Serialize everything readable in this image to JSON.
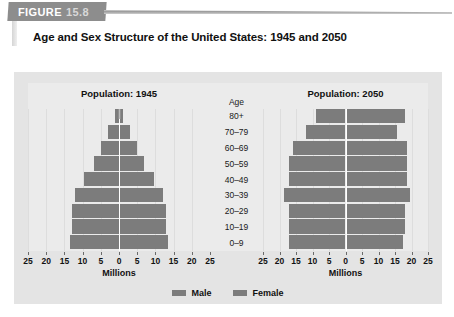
{
  "figure": {
    "tag_word": "FIGURE",
    "tag_number": "15.8",
    "title": "Age and Sex Structure of the United States: 1945 and 2050"
  },
  "legend": {
    "male_label": "Male",
    "female_label": "Female",
    "male_color": "#7c7c7c",
    "female_color": "#7c7c7c"
  },
  "age_column": {
    "header": "Age",
    "groups": [
      "80+",
      "70–79",
      "60–69",
      "50–59",
      "40–49",
      "30–39",
      "20–29",
      "10–19",
      "0–9"
    ]
  },
  "axis": {
    "name": "Millions",
    "tick_labels": [
      "25",
      "20",
      "15",
      "10",
      "5",
      "0",
      "5",
      "10",
      "15",
      "20",
      "25"
    ],
    "max": 25,
    "step": 5
  },
  "panels": [
    {
      "title": "Population: 1945"
    },
    {
      "title": "Population: 2050"
    }
  ],
  "chart_data": [
    {
      "type": "bar",
      "title": "Population: 1945",
      "subtype": "population-pyramid",
      "xlabel": "Millions",
      "ylabel": "Age",
      "xlim": [
        -25,
        25
      ],
      "grid": true,
      "legend_position": "bottom",
      "categories": [
        "80+",
        "70–79",
        "60–69",
        "50–59",
        "40–49",
        "30–39",
        "20–29",
        "10–19",
        "0–9"
      ],
      "series": [
        {
          "name": "Male",
          "side": "left",
          "values": [
            1.0,
            3.0,
            5.0,
            7.0,
            9.5,
            12.0,
            13.0,
            13.0,
            13.5
          ]
        },
        {
          "name": "Female",
          "side": "right",
          "values": [
            1.0,
            3.0,
            5.0,
            7.0,
            9.5,
            12.0,
            13.0,
            13.0,
            13.5
          ]
        }
      ]
    },
    {
      "type": "bar",
      "title": "Population: 2050",
      "subtype": "population-pyramid",
      "xlabel": "Millions",
      "ylabel": "Age",
      "xlim": [
        -25,
        25
      ],
      "grid": true,
      "legend_position": "bottom",
      "categories": [
        "80+",
        "70–79",
        "60–69",
        "50–59",
        "40–49",
        "30–39",
        "20–29",
        "10–19",
        "0–9"
      ],
      "series": [
        {
          "name": "Male",
          "side": "left",
          "values": [
            9.0,
            12.0,
            16.0,
            17.0,
            17.0,
            18.5,
            17.0,
            17.0,
            17.0
          ]
        },
        {
          "name": "Female",
          "side": "right",
          "values": [
            18.0,
            15.5,
            18.5,
            18.5,
            18.5,
            19.5,
            18.0,
            18.0,
            17.5
          ]
        }
      ]
    }
  ]
}
